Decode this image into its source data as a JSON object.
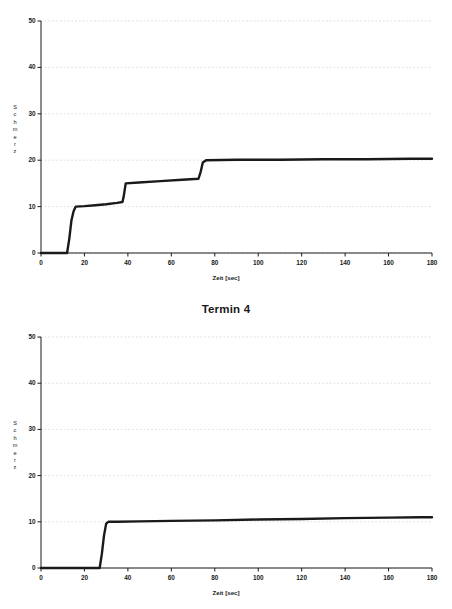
{
  "page": {
    "title": "Termin 4",
    "background_color": "#ffffff",
    "ink_color": "#1a1a1a",
    "grid_color": "#c8c8c8"
  },
  "axis_common": {
    "ylabel_letters": [
      "S",
      "c",
      "h",
      "m",
      "e",
      "r",
      "z"
    ],
    "ylabel_text": "Schmerz",
    "xlabel": "Zeit [sec]",
    "yticks": [
      "0",
      "10",
      "20",
      "30",
      "40",
      "50"
    ],
    "xticks": [
      "0",
      "20",
      "40",
      "60",
      "80",
      "100",
      "120",
      "140",
      "160",
      "180"
    ]
  },
  "chart_data": [
    {
      "id": "chart-top",
      "type": "line",
      "title": "",
      "xlabel": "Zeit [sec]",
      "ylabel": "Schmerz",
      "xlim": [
        0,
        180
      ],
      "ylim": [
        0,
        50
      ],
      "xticks": [
        0,
        20,
        40,
        60,
        80,
        100,
        120,
        140,
        160,
        180
      ],
      "yticks": [
        0,
        10,
        20,
        30,
        40,
        50
      ],
      "grid": true,
      "legend": "none",
      "line_color": "#1a1a1a",
      "line_width": 2.4,
      "series": [
        {
          "name": "Schmerz",
          "x": [
            0,
            12,
            13,
            14,
            15,
            16,
            20,
            25,
            30,
            35,
            37.5,
            38,
            39,
            45,
            55,
            65,
            72.5,
            73.5,
            74.5,
            76,
            90,
            110,
            130,
            150,
            170,
            180
          ],
          "y": [
            0,
            0,
            3,
            7,
            9,
            10,
            10.1,
            10.3,
            10.5,
            10.8,
            11,
            12,
            15,
            15.2,
            15.5,
            15.8,
            16,
            17.5,
            19.5,
            20,
            20.1,
            20.1,
            20.2,
            20.2,
            20.3,
            20.3
          ]
        }
      ],
      "annotations": {
        "step_times_sec": [
          13,
          38,
          74
        ],
        "plateau_values": [
          10,
          15,
          20
        ],
        "final_value": 20.3
      }
    },
    {
      "id": "chart-bottom",
      "type": "line",
      "title": "",
      "xlabel": "Zeit [sec]",
      "ylabel": "Schmerz",
      "xlim": [
        0,
        180
      ],
      "ylim": [
        0,
        50
      ],
      "xticks": [
        0,
        20,
        40,
        60,
        80,
        100,
        120,
        140,
        160,
        180
      ],
      "yticks": [
        0,
        10,
        20,
        30,
        40,
        50
      ],
      "grid": true,
      "legend": "none",
      "line_color": "#1a1a1a",
      "line_width": 2.4,
      "series": [
        {
          "name": "Schmerz",
          "x": [
            0,
            20,
            27,
            28,
            29,
            30,
            31,
            35,
            45,
            60,
            80,
            100,
            120,
            140,
            160,
            175,
            180
          ],
          "y": [
            0,
            0,
            0,
            3,
            7,
            9.6,
            10,
            10,
            10.1,
            10.2,
            10.3,
            10.5,
            10.6,
            10.8,
            10.9,
            11,
            11
          ]
        }
      ],
      "annotations": {
        "step_times_sec": [
          28
        ],
        "plateau_values": [
          10
        ],
        "final_value": 11
      }
    }
  ]
}
